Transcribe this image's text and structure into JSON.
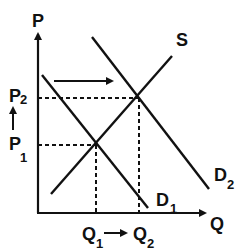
{
  "diagram": {
    "type": "supply-demand",
    "axes": {
      "y_label": "P",
      "x_label": "Q"
    },
    "curves": [
      {
        "id": "S",
        "label": "S",
        "kind": "supply"
      },
      {
        "id": "D1",
        "label": "D",
        "subscript": "1",
        "kind": "demand"
      },
      {
        "id": "D2",
        "label": "D",
        "subscript": "2",
        "kind": "demand"
      }
    ],
    "price_levels": [
      {
        "label": "P",
        "subscript": "1"
      },
      {
        "label": "P",
        "subscript": "2"
      }
    ],
    "quantity_levels": [
      {
        "label": "Q",
        "subscript": "1"
      },
      {
        "label": "Q",
        "subscript": "2"
      }
    ],
    "shift": "Demand shifts right from D1 to D2; price rises P1 to P2; quantity rises Q1 to Q2",
    "colors": {
      "ink": "#111111",
      "background": "#ffffff"
    }
  }
}
